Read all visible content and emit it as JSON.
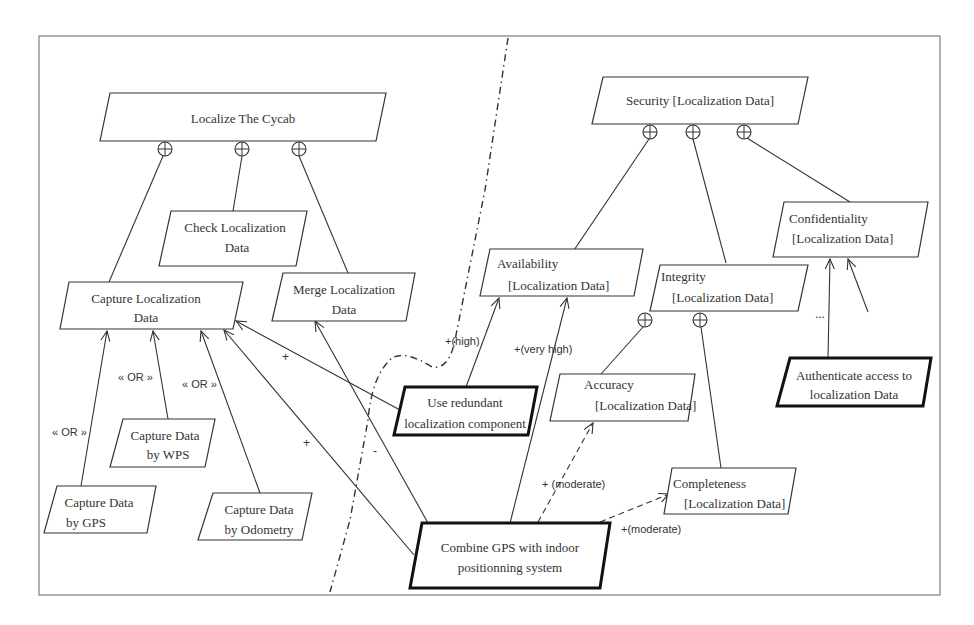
{
  "diagram": {
    "type": "goal-refinement-model",
    "left_tree": {
      "root": "Localize The  Cycab",
      "children": {
        "capture": [
          "Capture Localization",
          "Data"
        ],
        "check": [
          "Check Localization",
          "Data"
        ],
        "merge": [
          "Merge Localization",
          "Data"
        ]
      },
      "capture_options": {
        "wps": [
          "Capture Data",
          "by WPS"
        ],
        "gps": [
          "Capture Data",
          "by GPS"
        ],
        "odometry": [
          "Capture Data",
          "by Odometry"
        ]
      },
      "or_label": "« OR »"
    },
    "right_tree": {
      "root": "Security [Localization Data]",
      "availability": [
        "Availability",
        "[Localization Data]"
      ],
      "integrity": [
        "Integrity",
        "[Localization Data]"
      ],
      "confidentiality": [
        "Confidentiality",
        "[Localization Data]"
      ],
      "accuracy": [
        "Accuracy",
        "[Localization Data]"
      ],
      "completeness": [
        "Completeness",
        "[Localization Data]"
      ],
      "ellipsis": "..."
    },
    "operationalizations": {
      "redundant": [
        "Use redundant",
        "localization component"
      ],
      "combine": [
        "Combine GPS with indoor",
        "positionning system"
      ],
      "authenticate": [
        "Authenticate access to",
        "localization Data"
      ]
    },
    "contribution_labels": {
      "plus": "+",
      "minus": "-",
      "high": "+(high)",
      "very_high": "+(very high)",
      "moderate_accuracy": "+ (moderate)",
      "moderate_completeness": "+(moderate)"
    },
    "colors": {
      "stroke": "#333333",
      "background": "#ffffff",
      "text": "#333333"
    }
  }
}
